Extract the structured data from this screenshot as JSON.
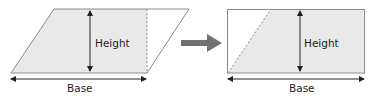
{
  "diagram": {
    "left": {
      "shape": "parallelogram",
      "height_label": "Height",
      "base_label": "Base"
    },
    "transform_arrow": "right-arrow",
    "right": {
      "shape": "rectangle",
      "height_label": "Height",
      "base_label": "Base"
    }
  },
  "colors": {
    "fill": "#e9e9e9",
    "stroke": "#8a8a8a",
    "arrow": "#231f20",
    "transform_arrow": "#707070"
  }
}
